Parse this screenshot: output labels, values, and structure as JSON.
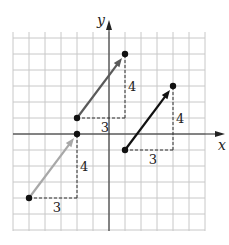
{
  "diagram": {
    "title": "",
    "axes": {
      "x_label": "x",
      "y_label": "y",
      "xlim": [
        -6,
        6
      ],
      "ylim": [
        -6,
        6
      ],
      "grid": true
    },
    "colors": {
      "grid": "#c8c8c8",
      "axis": "#222222",
      "dashed": "#333333",
      "vector_light": "#a8a8a8",
      "vector_mid": "#5a5a5a",
      "vector_dark": "#111111",
      "point": "#111111"
    },
    "vectors": [
      {
        "name": "vector-light",
        "from": [
          -5,
          -4
        ],
        "to": [
          -2,
          0
        ],
        "color": "vector_light",
        "run_label": "3",
        "rise_label": "4"
      },
      {
        "name": "vector-mid",
        "from": [
          -2,
          1
        ],
        "to": [
          1,
          5
        ],
        "color": "vector_mid",
        "run_label": "3",
        "rise_label": "4"
      },
      {
        "name": "vector-dark",
        "from": [
          1,
          -1
        ],
        "to": [
          4,
          3
        ],
        "color": "vector_dark",
        "run_label": "3",
        "rise_label": "4"
      }
    ]
  }
}
